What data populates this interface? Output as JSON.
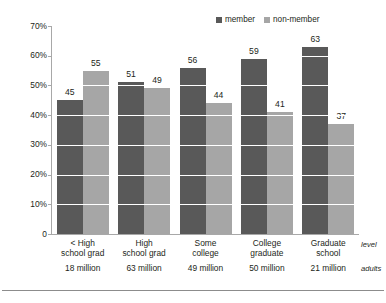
{
  "chart_data": {
    "type": "bar",
    "title": "",
    "subtitle": "",
    "xlabel": "level",
    "xlabel2": "adults",
    "ylabel": "",
    "ylim": [
      0,
      70
    ],
    "ytick_labels": [
      "70%",
      "60%",
      "50%",
      "40%",
      "30%",
      "20%",
      "10%",
      "0"
    ],
    "ytick_values": [
      70,
      60,
      50,
      40,
      30,
      20,
      10,
      0
    ],
    "grid": true,
    "legend_position": "top-right",
    "categories": [
      "< High school grad",
      "High school grad",
      "Some college",
      "College graduate",
      "Graduate school"
    ],
    "category_lines": [
      [
        "< High",
        "school grad"
      ],
      [
        "High",
        "school grad"
      ],
      [
        "Some",
        "college"
      ],
      [
        "College",
        "graduate"
      ],
      [
        "Graduate",
        "school"
      ]
    ],
    "category_subtitles": [
      "18 million",
      "63 million",
      "49 million",
      "50 million",
      "21 million"
    ],
    "series": [
      {
        "name": "member",
        "color": "#595959",
        "values": [
          45,
          51,
          56,
          59,
          63
        ]
      },
      {
        "name": "non-member",
        "color": "#a6a6a6",
        "values": [
          55,
          49,
          44,
          41,
          37
        ]
      }
    ]
  },
  "legend": {
    "entries": [
      {
        "label": "member",
        "color": "#595959"
      },
      {
        "label": "non-member",
        "color": "#a6a6a6"
      }
    ]
  },
  "colors": {
    "member": "#595959",
    "non_member": "#a6a6a6",
    "axis": "#a8a8a8",
    "gridline": "#ffffff",
    "text": "#231f20",
    "rule": "#8c8c8c",
    "background": "#ffffff"
  }
}
